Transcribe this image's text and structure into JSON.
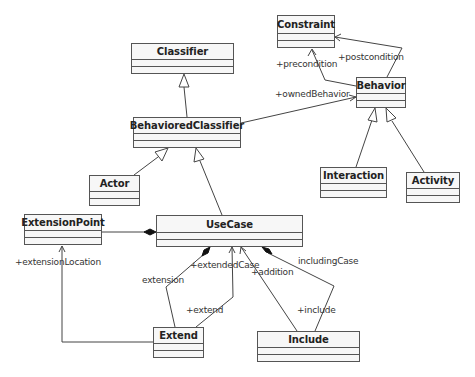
{
  "diagram": {
    "type": "UML class diagram",
    "classes": [
      {
        "id": "constraint",
        "name": "Constraint"
      },
      {
        "id": "classifier",
        "name": "Classifier"
      },
      {
        "id": "behavior",
        "name": "Behavior"
      },
      {
        "id": "behavioredclassifier",
        "name": "BehavioredClassifier"
      },
      {
        "id": "actor",
        "name": "Actor"
      },
      {
        "id": "interaction",
        "name": "Interaction"
      },
      {
        "id": "activity",
        "name": "Activity"
      },
      {
        "id": "extensionpoint",
        "name": "ExtensionPoint"
      },
      {
        "id": "usecase",
        "name": "UseCase"
      },
      {
        "id": "extend",
        "name": "Extend"
      },
      {
        "id": "include",
        "name": "Include"
      }
    ],
    "labels": {
      "postcondition": "+postcondition",
      "precondition": "+precondition",
      "ownedBehavior": "+ownedBehavior",
      "extensionLocation": "+extensionLocation",
      "extendedCase": "+extendedCase",
      "extension": "extension",
      "extend": "+extend",
      "addition": "+addition",
      "includingCase": "includingCase",
      "include": "+include"
    },
    "relationships": [
      {
        "kind": "generalization",
        "from": "BehavioredClassifier",
        "to": "Classifier"
      },
      {
        "kind": "generalization",
        "from": "Actor",
        "to": "BehavioredClassifier"
      },
      {
        "kind": "generalization",
        "from": "UseCase",
        "to": "BehavioredClassifier"
      },
      {
        "kind": "generalization",
        "from": "Interaction",
        "to": "Behavior"
      },
      {
        "kind": "generalization",
        "from": "Activity",
        "to": "Behavior"
      },
      {
        "kind": "association",
        "from": "Behavior",
        "to": "Constraint",
        "role": "+precondition"
      },
      {
        "kind": "association",
        "from": "Behavior",
        "to": "Constraint",
        "role": "+postcondition"
      },
      {
        "kind": "association",
        "from": "BehavioredClassifier",
        "to": "Behavior",
        "role": "+ownedBehavior"
      },
      {
        "kind": "composition",
        "from": "UseCase",
        "to": "ExtensionPoint"
      },
      {
        "kind": "association",
        "from": "Extend",
        "to": "ExtensionPoint",
        "role": "+extensionLocation"
      },
      {
        "kind": "composition",
        "from": "UseCase",
        "to": "Extend",
        "roles": [
          "extension",
          "+extend"
        ]
      },
      {
        "kind": "association",
        "from": "Extend",
        "to": "UseCase",
        "role": "+extendedCase"
      },
      {
        "kind": "association",
        "from": "Include",
        "to": "UseCase",
        "role": "+addition"
      },
      {
        "kind": "composition",
        "from": "UseCase",
        "to": "Include",
        "roles": [
          "includingCase",
          "+include"
        ]
      }
    ]
  }
}
